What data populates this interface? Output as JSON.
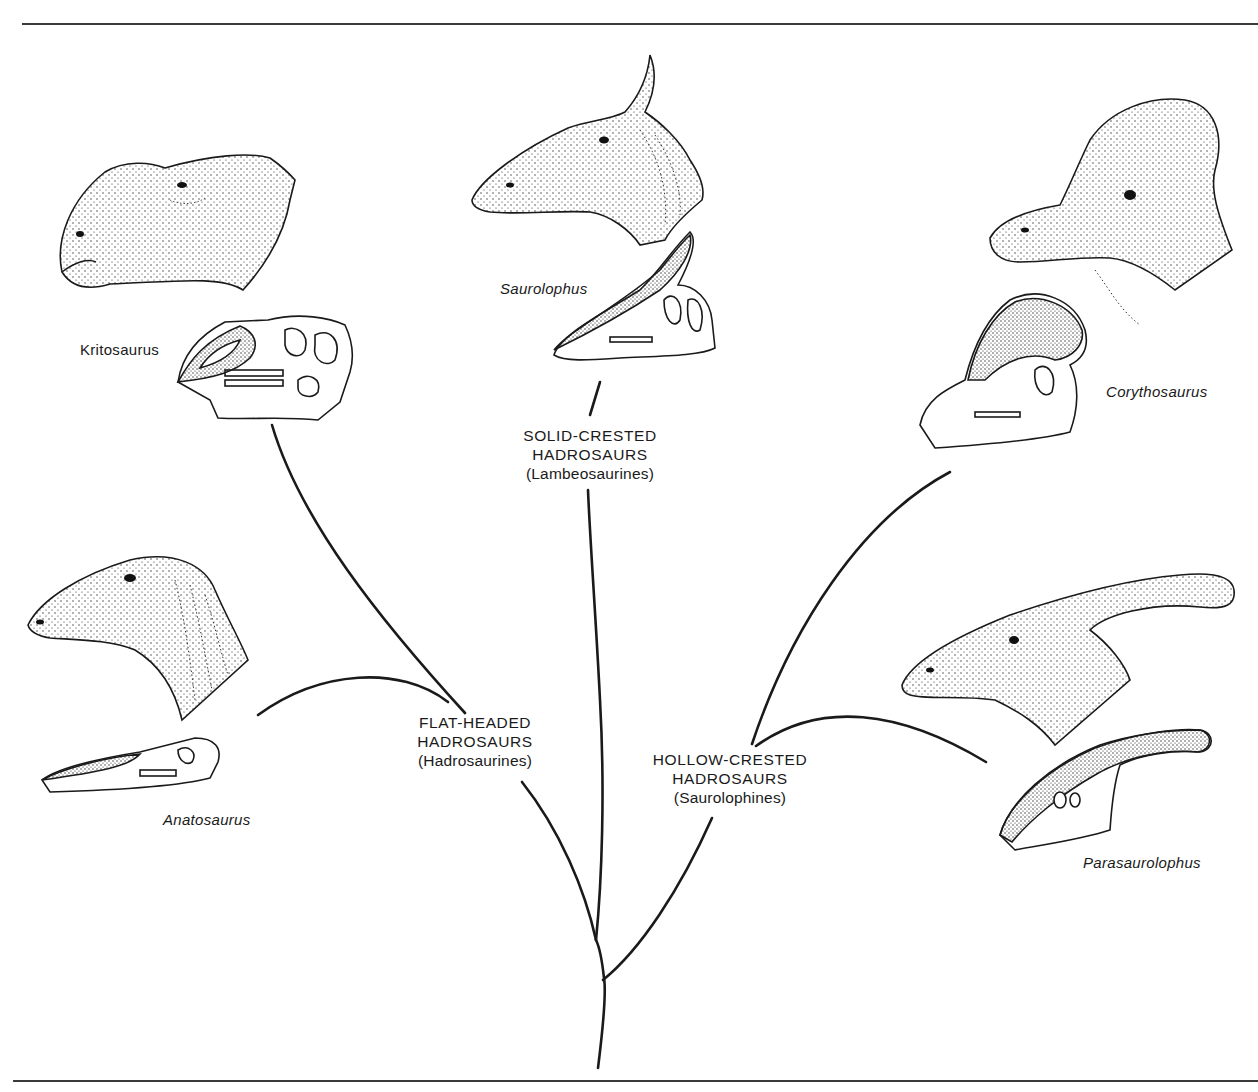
{
  "figure": {
    "type": "phylogenetic-tree",
    "line_color": "#1a1a1a",
    "stipple_color": "#2a2a2a"
  },
  "groups": {
    "flat_headed": {
      "line1": "FLAT-HEADED",
      "line2": "HADROSAURS",
      "line3": "(Hadrosaurines)"
    },
    "solid_crested": {
      "line1": "SOLID-CRESTED",
      "line2": "HADROSAURS",
      "line3": "(Lambeosaurines)"
    },
    "hollow_crested": {
      "line1": "HOLLOW-CRESTED",
      "line2": "HADROSAURS",
      "line3": "(Saurolophines)"
    }
  },
  "genera": {
    "kritosaurus": "Kritosaurus",
    "anatosaurus": "Anatosaurus",
    "saurolophus": "Saurolophus",
    "corythosaurus": "Corythosaurus",
    "parasaurolophus": "Parasaurolophus"
  },
  "tree": {
    "root": "base trunk",
    "branches": [
      {
        "group": "FLAT-HEADED HADROSAURS",
        "leaves": [
          "Kritosaurus",
          "Anatosaurus"
        ]
      },
      {
        "group": "SOLID-CRESTED HADROSAURS",
        "leaves": [
          "Saurolophus"
        ]
      },
      {
        "group": "HOLLOW-CRESTED HADROSAURS",
        "leaves": [
          "Corythosaurus",
          "Parasaurolophus"
        ]
      }
    ]
  }
}
